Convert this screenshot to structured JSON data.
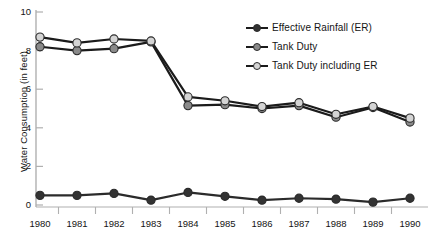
{
  "chart_data": {
    "type": "line",
    "title": "",
    "xlabel": "",
    "ylabel": "Water Consumption (in feet)",
    "categories": [
      "1980",
      "1981",
      "1982",
      "1983",
      "1984",
      "1985",
      "1986",
      "1987",
      "1988",
      "1989",
      "1990"
    ],
    "xlim": [
      1980,
      1990
    ],
    "ylim": [
      0,
      10
    ],
    "yticks": [
      "0",
      "2",
      "4",
      "6",
      "8",
      "10"
    ],
    "ytick_values": [
      0,
      2,
      4,
      6,
      8,
      10
    ],
    "grid": false,
    "legend_position": "top-right",
    "series": [
      {
        "name": "Effective Rainfall (ER)",
        "color": "#2b2b2b",
        "marker_color": "#333333",
        "values": [
          0.5,
          0.5,
          0.6,
          0.25,
          0.65,
          0.45,
          0.25,
          0.35,
          0.3,
          0.15,
          0.35
        ]
      },
      {
        "name": "Tank Duty",
        "color": "#1b1b1b",
        "marker_color": "#8a8a8a",
        "values": [
          8.2,
          8.0,
          8.1,
          8.45,
          5.15,
          5.2,
          5.0,
          5.15,
          4.55,
          5.05,
          4.3
        ]
      },
      {
        "name": "Tank Duty including ER",
        "color": "#1b1b1b",
        "marker_color": "#d4d4d4",
        "values": [
          8.7,
          8.4,
          8.6,
          8.5,
          5.6,
          5.4,
          5.1,
          5.3,
          4.7,
          5.1,
          4.5
        ]
      }
    ]
  },
  "axes": {
    "y_title": "Water Consumption (in feet)",
    "axis_color": "#b0b0b0"
  },
  "legend": {
    "entries": [
      {
        "label": "Effective Rainfall (ER)",
        "swatch": "line-marker-dark"
      },
      {
        "label": "Tank Duty",
        "swatch": "line-marker-gray"
      },
      {
        "label": "Tank Duty including ER",
        "swatch": "line-marker-light"
      }
    ]
  }
}
